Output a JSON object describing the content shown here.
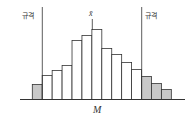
{
  "labels": {
    "spec_left": "규격",
    "spec_right": "규격",
    "mean": "x̄",
    "axis": "M"
  },
  "colors": {
    "stroke": "#333333",
    "in_spec_fill": "#ffffff",
    "out_of_spec_fill": "#c8c8c8"
  },
  "chart_data": {
    "type": "bar",
    "title": "",
    "xlabel": "M",
    "ylabel": "",
    "categories": [
      "1",
      "2",
      "3",
      "4",
      "5",
      "6",
      "7",
      "8",
      "9",
      "10",
      "11",
      "12",
      "13",
      "14"
    ],
    "values": [
      15,
      24,
      29,
      34,
      59,
      64,
      70,
      51,
      45,
      37,
      30,
      23,
      16,
      10
    ],
    "out_of_spec": [
      true,
      false,
      false,
      false,
      false,
      false,
      false,
      false,
      false,
      false,
      false,
      true,
      true,
      true
    ],
    "spec_lower_after_bar": 1,
    "spec_upper_after_bar": 11,
    "mean_at_bar": 7,
    "grid": false,
    "legend": null
  }
}
